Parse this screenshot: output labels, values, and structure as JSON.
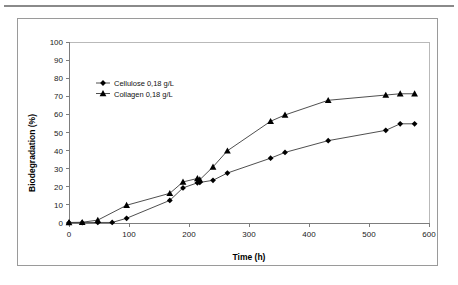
{
  "figure": {
    "background_color": "#ffffff",
    "frame_color": "#9a9a9a",
    "rule_color": "#8a8a8a"
  },
  "chart_data": {
    "type": "line",
    "title": "",
    "subtitle": "",
    "xlabel": "Time (h)",
    "ylabel": "Biodegradation (%)",
    "xlim": [
      0,
      600
    ],
    "ylim": [
      0,
      100
    ],
    "xticks": [
      0,
      100,
      200,
      300,
      400,
      500,
      600
    ],
    "yticks": [
      0,
      10,
      20,
      30,
      40,
      50,
      60,
      70,
      80,
      90,
      100
    ],
    "grid": false,
    "legend_position": "upper-left-inside",
    "series": [
      {
        "name": "Cellulose 0,18 g/L",
        "marker": "diamond",
        "color": "#000000",
        "line_color": "#3b3b3b",
        "x": [
          0,
          22,
          48,
          72,
          96,
          168,
          190,
          214,
          218,
          240,
          264,
          336,
          360,
          432,
          528,
          552,
          576
        ],
        "y": [
          0.2,
          0.2,
          0.3,
          0.3,
          2.6,
          12.5,
          19.4,
          22.2,
          22.4,
          23.6,
          27.6,
          35.8,
          39.0,
          45.5,
          51.2,
          54.8,
          54.8
        ]
      },
      {
        "name": "Collagen 0,18 g/L",
        "marker": "triangle",
        "color": "#000000",
        "line_color": "#3b3b3b",
        "x": [
          0,
          22,
          48,
          96,
          168,
          190,
          214,
          218,
          240,
          264,
          336,
          360,
          432,
          528,
          552,
          576
        ],
        "y": [
          0.3,
          0.4,
          1.6,
          9.8,
          16.4,
          22.7,
          24.6,
          23.9,
          31.0,
          39.9,
          56.2,
          59.7,
          67.8,
          70.7,
          71.4,
          71.4
        ]
      }
    ]
  },
  "legend": {
    "entries": [
      {
        "label": "Cellulose 0,18 g/L",
        "marker": "diamond"
      },
      {
        "label": "Collagen 0,18 g/L",
        "marker": "triangle"
      }
    ]
  }
}
